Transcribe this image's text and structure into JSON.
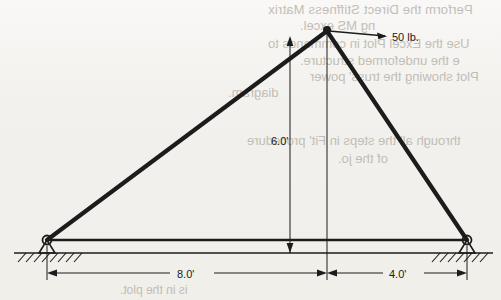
{
  "page": {
    "background_color": "#f2f0ec",
    "ink_color": "#1c1c1c"
  },
  "figure": {
    "name": "truss-free-body-diagram",
    "type": "statics truss diagram",
    "labels": {
      "load": "50 lb.",
      "height": "6.0'",
      "span_left": "8.0'",
      "span_right": "4.0'"
    },
    "geometry": {
      "apex": [
        327,
        30
      ],
      "left_support": [
        47,
        240
      ],
      "right_support": [
        467,
        240
      ],
      "ground_y": 253,
      "height_dim_top": [
        290,
        35
      ],
      "height_dim_bottom": [
        290,
        253
      ],
      "load_arrow_from": [
        327,
        30
      ],
      "load_arrow_to": [
        388,
        36
      ]
    }
  },
  "bleedthrough_text": {
    "line1": "Perform the Direct Stiffness Matrix",
    "line2": "ng MS excel.",
    "line3": "Use the Excel Plot in commands to",
    "line4": "e the undeformed structure.",
    "line5": "Plot showing the truss' power",
    "line6": "diagram.",
    "line7": "through all the steps in Fit' procedure",
    "line8": "of the jo.",
    "line9": "is in the plot."
  }
}
